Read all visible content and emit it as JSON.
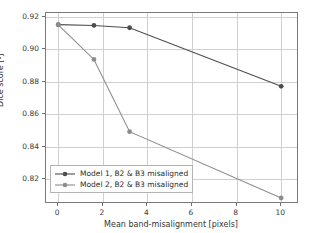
{
  "chart_data": {
    "type": "line",
    "title": "",
    "xlabel": "Mean band-misalignment [pixels]",
    "ylabel": "Dice score [-]",
    "xlim": [
      -0.55,
      10.8
    ],
    "ylim": [
      0.8045,
      0.9225
    ],
    "xticks": [
      0,
      2,
      4,
      6,
      8,
      10
    ],
    "xtick_labels": [
      "0",
      "2",
      "4",
      "6",
      "8",
      "10"
    ],
    "yticks": [
      0.82,
      0.84,
      0.86,
      0.88,
      0.9,
      0.92
    ],
    "ytick_labels": [
      "0.82",
      "0.84",
      "0.86",
      "0.88",
      "0.90",
      "0.92"
    ],
    "grid": true,
    "legend_position": "lower left",
    "series": [
      {
        "name": "Model 1, B2 & B3 misaligned",
        "color": "#4d4d4d",
        "marker": "circle",
        "x": [
          0,
          1.6,
          3.2,
          10
        ],
        "values": [
          0.9153,
          0.9148,
          0.9134,
          0.8772
        ]
      },
      {
        "name": "Model 2, B2 & B3 misaligned",
        "color": "#8c8c8c",
        "marker": "circle",
        "x": [
          0,
          1.6,
          3.2,
          10
        ],
        "values": [
          0.9152,
          0.8938,
          0.8492,
          0.8082
        ]
      }
    ]
  },
  "axes": {
    "frame_color": "#7a7a7a",
    "grid_color": "#cfcfcf",
    "tick_color": "#6e6e6e"
  },
  "legend": {
    "entries": [
      "Model 1, B2 & B3 misaligned",
      "Model 2, B2 & B3 misaligned"
    ]
  }
}
